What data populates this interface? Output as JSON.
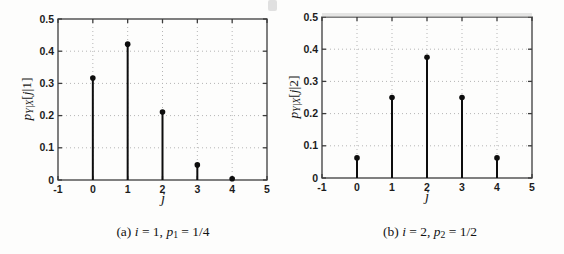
{
  "figure_title": "",
  "chart_data": [
    {
      "type": "stem",
      "x": [
        0,
        1,
        2,
        3,
        4
      ],
      "values": [
        0.3164,
        0.4219,
        0.2109,
        0.0469,
        0.0039
      ],
      "xlim": [
        -1,
        5
      ],
      "ylim": [
        0,
        0.5
      ],
      "xticks": [
        -1,
        0,
        1,
        2,
        3,
        4,
        5
      ],
      "xtick_labels": [
        "-1",
        "0",
        "1",
        "2",
        "3",
        "4",
        "5"
      ],
      "yticks": [
        0,
        0.1,
        0.2,
        0.3,
        0.4,
        0.5
      ],
      "ytick_labels": [
        "0",
        "0.1",
        "0.2",
        "0.3",
        "0.4",
        "0.5"
      ],
      "xlabel": "j",
      "grid": true,
      "legend": null,
      "ylabel_runs": [
        {
          "t": "p",
          "it": 1
        },
        {
          "t": "Y|X",
          "it": 1,
          "sub": 1
        },
        {
          "t": "["
        },
        {
          "t": "j",
          "it": 1
        },
        {
          "t": "|1]"
        }
      ],
      "caption_runs": [
        {
          "t": "(a) "
        },
        {
          "t": "i",
          "it": 1
        },
        {
          "t": " = 1, "
        },
        {
          "t": "p",
          "it": 1
        },
        {
          "t": "1",
          "sub": 1
        },
        {
          "t": " = 1/4"
        }
      ],
      "stem_color": "#0d0d0d",
      "grid_color": "#b5b5b5",
      "axis_color": "#3c3c3c"
    },
    {
      "type": "stem",
      "x": [
        0,
        1,
        2,
        3,
        4
      ],
      "values": [
        0.0625,
        0.25,
        0.375,
        0.25,
        0.0625
      ],
      "xlim": [
        -1,
        5
      ],
      "ylim": [
        0,
        0.5
      ],
      "xticks": [
        -1,
        0,
        1,
        2,
        3,
        4,
        5
      ],
      "xtick_labels": [
        "-1",
        "0",
        "1",
        "2",
        "3",
        "4",
        "5"
      ],
      "yticks": [
        0,
        0.1,
        0.2,
        0.3,
        0.4,
        0.5
      ],
      "ytick_labels": [
        "0",
        "0.1",
        "0.2",
        "0.3",
        "0.4",
        "0.5"
      ],
      "xlabel": "j",
      "grid": true,
      "legend": null,
      "ylabel_runs": [
        {
          "t": "p",
          "it": 1
        },
        {
          "t": "Y|X",
          "it": 1,
          "sub": 1
        },
        {
          "t": "["
        },
        {
          "t": "j",
          "it": 1
        },
        {
          "t": "|2]"
        }
      ],
      "caption_runs": [
        {
          "t": "(b) "
        },
        {
          "t": "i",
          "it": 1
        },
        {
          "t": " = 2, "
        },
        {
          "t": "p",
          "it": 1
        },
        {
          "t": "2",
          "sub": 1
        },
        {
          "t": " = 1/2"
        }
      ],
      "stem_color": "#0d0d0d",
      "grid_color": "#b5b5b5",
      "axis_color": "#3c3c3c"
    }
  ]
}
